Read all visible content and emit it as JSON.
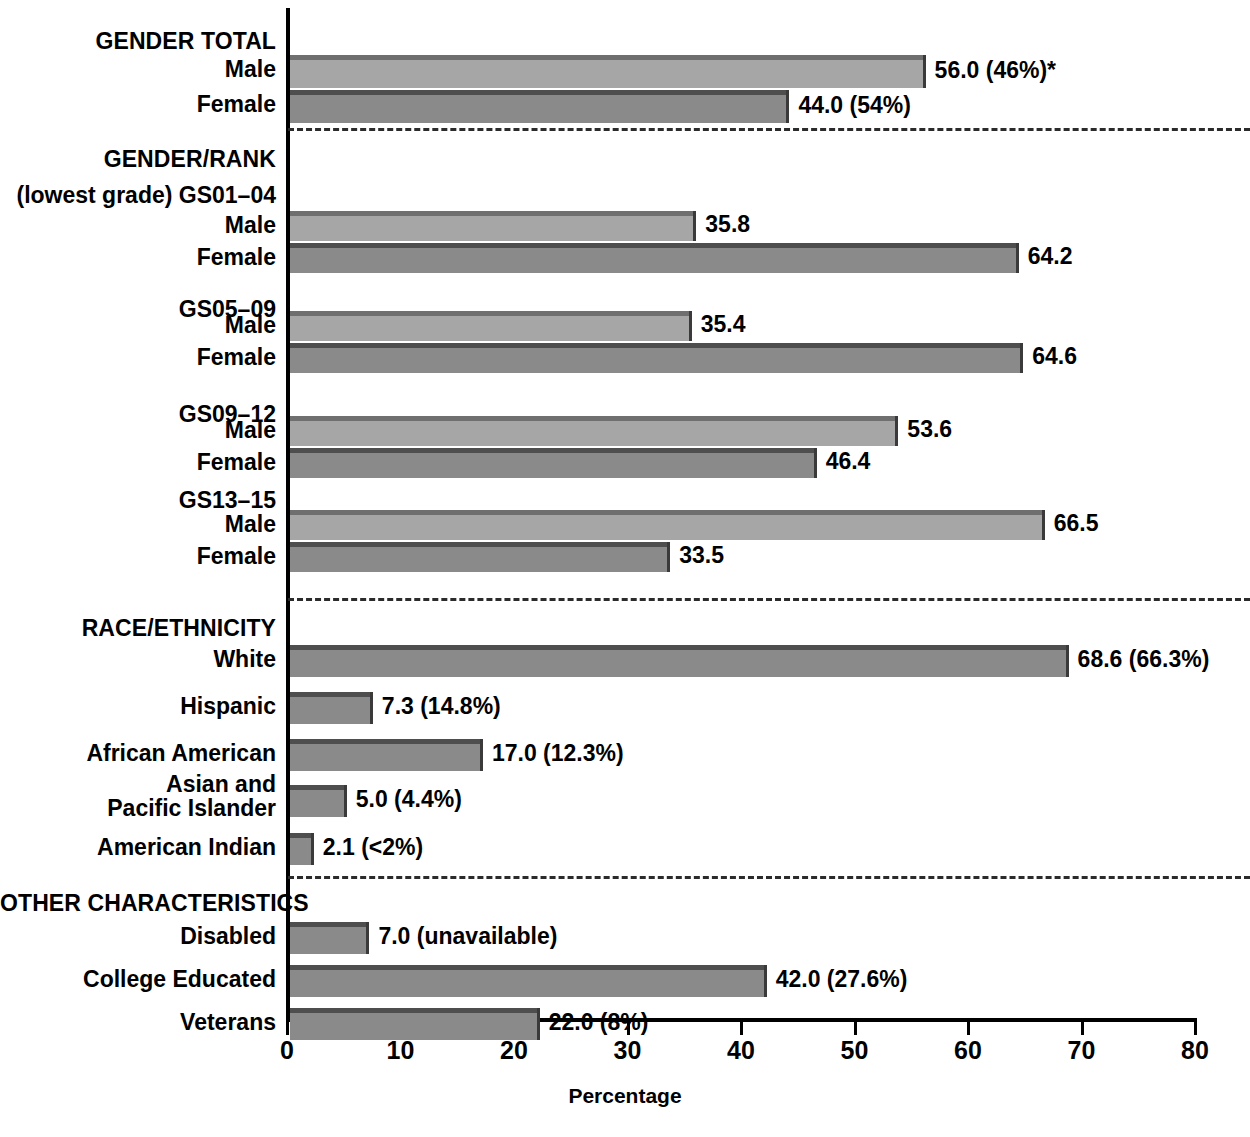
{
  "chart_data": {
    "type": "bar",
    "title": "",
    "xlabel": "Percentage",
    "ylabel": "",
    "xlim": [
      0,
      80
    ],
    "grid": false,
    "legend": "none",
    "orientation": "horizontal",
    "xticks": [
      "0",
      "10",
      "20",
      "30",
      "40",
      "50",
      "60",
      "70",
      "80"
    ],
    "xtick_values": [
      0,
      10,
      20,
      30,
      40,
      50,
      60,
      70,
      80
    ],
    "footnote": "",
    "sections": [
      {
        "heading": "GENDER TOTAL",
        "subheading": "",
        "rows": [
          {
            "label": "Male",
            "value": 56.0,
            "value_label": "56.0 (46%)*",
            "shade": "light"
          },
          {
            "label": "Female",
            "value": 44.0,
            "value_label": "44.0 (54%)",
            "shade": "dark"
          }
        ]
      },
      {
        "heading": "GENDER/RANK",
        "subheading": "",
        "groups": [
          {
            "group_label": "(lowest grade) GS01–04",
            "rows": [
              {
                "label": "Male",
                "value": 35.8,
                "value_label": "35.8",
                "shade": "light"
              },
              {
                "label": "Female",
                "value": 64.2,
                "value_label": "64.2",
                "shade": "dark"
              }
            ]
          },
          {
            "group_label": "GS05–09",
            "rows": [
              {
                "label": "Male",
                "value": 35.4,
                "value_label": "35.4",
                "shade": "light"
              },
              {
                "label": "Female",
                "value": 64.6,
                "value_label": "64.6",
                "shade": "dark"
              }
            ]
          },
          {
            "group_label": "GS09–12",
            "rows": [
              {
                "label": "Male",
                "value": 53.6,
                "value_label": "53.6",
                "shade": "light"
              },
              {
                "label": "Female",
                "value": 46.4,
                "value_label": "46.4",
                "shade": "dark"
              }
            ]
          },
          {
            "group_label": "GS13–15",
            "rows": [
              {
                "label": "Male",
                "value": 66.5,
                "value_label": "66.5",
                "shade": "light"
              },
              {
                "label": "Female",
                "value": 33.5,
                "value_label": "33.5",
                "shade": "dark"
              }
            ]
          }
        ]
      },
      {
        "heading": "RACE/ETHNICITY",
        "subheading": "",
        "rows": [
          {
            "label": "White",
            "value": 68.6,
            "value_label": "68.6 (66.3%)",
            "shade": "dark"
          },
          {
            "label": "Hispanic",
            "value": 7.3,
            "value_label": "7.3 (14.8%)",
            "shade": "dark"
          },
          {
            "label": "African American",
            "value": 17.0,
            "value_label": "17.0 (12.3%)",
            "shade": "dark"
          },
          {
            "label": "Asian and\nPacific Islander",
            "value": 5.0,
            "value_label": "5.0 (4.4%)",
            "shade": "dark"
          },
          {
            "label": "American Indian",
            "value": 2.1,
            "value_label": "2.1 (<2%)",
            "shade": "dark"
          }
        ]
      },
      {
        "heading": "OTHER CHARACTERISTICS",
        "subheading": "",
        "rows": [
          {
            "label": "Disabled",
            "value": 7.0,
            "value_label": "7.0 (unavailable)",
            "shade": "dark"
          },
          {
            "label": "College Educated",
            "value": 42.0,
            "value_label": "42.0 (27.6%)",
            "shade": "dark"
          },
          {
            "label": "Veterans",
            "value": 22.0,
            "value_label": "22.0 (8%)",
            "shade": "dark"
          }
        ]
      }
    ]
  },
  "labels": {
    "gender_total": "GENDER TOTAL",
    "gender_rank": "GENDER/RANK",
    "race_ethnicity": "RACE/ETHNICITY",
    "other_characteristics": "OTHER CHARACTERISTICS",
    "gs01": "(lowest grade) GS01–04",
    "gs05": "GS05–09",
    "gs09": "GS09–12",
    "gs13": "GS13–15",
    "male": "Male",
    "female": "Female",
    "percentage": "Percentage"
  },
  "colors": {
    "light_bar": "#a6a6a6",
    "light_bar_top": "#6f6f6f",
    "dark_bar": "#8a8a8a",
    "dark_bar_top": "#4e4e4e",
    "axis": "#000000",
    "text": "#000000"
  }
}
